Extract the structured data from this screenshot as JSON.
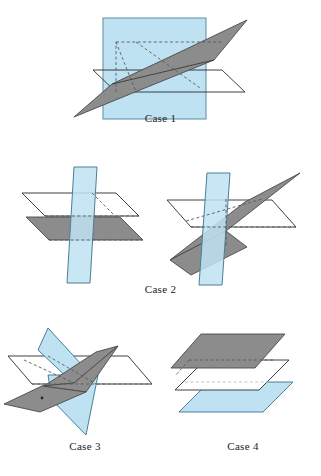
{
  "figure": {
    "title_visible": false,
    "background_color": "#ffffff",
    "palette": {
      "blue_fill": "#bfe2f3",
      "blue_edge": "#4a7f97",
      "gray_fill": "#8c8c8c",
      "gray_edge": "#4a4a4a",
      "white_fill": "#ffffff",
      "white_edge": "#2b2b2b",
      "hidden_edge": "#5a5a5a",
      "label_color": "#1c1c1c"
    }
  },
  "cases": [
    {
      "id": "case-1",
      "label": "Case 1",
      "description": "Three planes intersecting in a single common line",
      "planes": [
        {
          "name": "vertical-blue-plane",
          "color": "#bfe2f3",
          "orientation": "vertical"
        },
        {
          "name": "white-horizontal-plane",
          "color": "#ffffff",
          "orientation": "horizontal"
        },
        {
          "name": "gray-tilted-plane",
          "color": "#8c8c8c",
          "orientation": "tilted"
        }
      ]
    },
    {
      "id": "case-2",
      "label": "Case 2",
      "description": "Two sub-figures: planes meeting in parallel lines, and three planes meeting in one line",
      "planes": [
        {
          "name": "white-horizontal-plane",
          "color": "#ffffff",
          "orientation": "horizontal"
        },
        {
          "name": "gray-horizontal-plane",
          "color": "#8c8c8c",
          "orientation": "horizontal"
        },
        {
          "name": "blue-vertical-plane",
          "color": "#bfe2f3",
          "orientation": "vertical"
        },
        {
          "name": "gray-tilted-plane",
          "color": "#8c8c8c",
          "orientation": "tilted"
        }
      ]
    },
    {
      "id": "case-3",
      "label": "Case 3",
      "description": "Three planes meeting at a single common point",
      "planes": [
        {
          "name": "white-horizontal-plane",
          "color": "#ffffff",
          "orientation": "horizontal"
        },
        {
          "name": "blue-steep-plane",
          "color": "#bfe2f3",
          "orientation": "steep"
        },
        {
          "name": "gray-tilted-plane",
          "color": "#8c8c8c",
          "orientation": "tilted"
        }
      ]
    },
    {
      "id": "case-4",
      "label": "Case 4",
      "description": "Three mutually parallel planes stacked vertically",
      "planes": [
        {
          "name": "gray-top-plane",
          "color": "#8c8c8c",
          "orientation": "horizontal"
        },
        {
          "name": "white-middle-plane",
          "color": "#ffffff",
          "orientation": "horizontal"
        },
        {
          "name": "blue-bottom-plane",
          "color": "#bfe2f3",
          "orientation": "horizontal"
        }
      ]
    }
  ]
}
